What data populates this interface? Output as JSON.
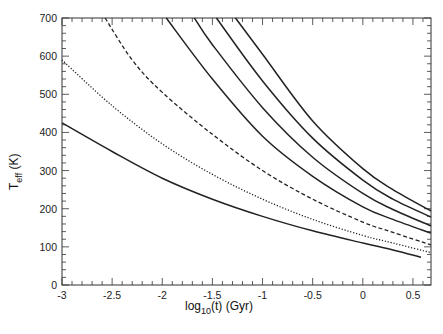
{
  "chart_data": {
    "type": "line",
    "title": "",
    "xlabel": "log10(t)  (Gyr)",
    "xlabel_parts": {
      "pre": "log",
      "sub": "10",
      "post": "(t)  (Gyr)"
    },
    "ylabel": "Teff  (K)",
    "ylabel_parts": {
      "main": "T",
      "sub": "eff",
      "post": " (K)"
    },
    "xlim": [
      -3,
      0.68
    ],
    "ylim": [
      0,
      700
    ],
    "x_ticks": [
      -3,
      -2.5,
      -2,
      -1.5,
      -1,
      -0.5,
      0,
      0.5
    ],
    "x_tick_labels": [
      "-3",
      "-2.5",
      "-2",
      "-1.5",
      "-1",
      "-0.5",
      "0",
      "0.5"
    ],
    "y_ticks": [
      0,
      100,
      200,
      300,
      400,
      500,
      600,
      700
    ],
    "y_tick_labels": [
      "0",
      "100",
      "200",
      "300",
      "400",
      "500",
      "600",
      "700"
    ],
    "grid": false,
    "legend": null,
    "series": [
      {
        "name": "curve-1",
        "style": "solid",
        "x": [
          -3.0,
          -2.5,
          -2.0,
          -1.5,
          -1.0,
          -0.5,
          0.0,
          0.3,
          0.58
        ],
        "y": [
          425,
          350,
          280,
          225,
          180,
          142,
          110,
          92,
          73
        ]
      },
      {
        "name": "curve-2",
        "style": "dotted",
        "x": [
          -3.0,
          -2.5,
          -2.0,
          -1.5,
          -1.0,
          -0.5,
          0.0,
          0.3,
          0.68
        ],
        "y": [
          590,
          470,
          370,
          290,
          225,
          172,
          130,
          110,
          85
        ]
      },
      {
        "name": "curve-3",
        "style": "dashed",
        "x": [
          -2.57,
          -2.3,
          -2.0,
          -1.5,
          -1.0,
          -0.5,
          0.0,
          0.3,
          0.68
        ],
        "y": [
          700,
          590,
          505,
          395,
          300,
          225,
          165,
          138,
          105
        ]
      },
      {
        "name": "curve-4",
        "style": "solid",
        "x": [
          -1.96,
          -1.5,
          -1.0,
          -0.5,
          0.0,
          0.3,
          0.68
        ],
        "y": [
          700,
          540,
          390,
          285,
          205,
          172,
          136
        ]
      },
      {
        "name": "curve-5",
        "style": "solid",
        "x": [
          -1.68,
          -1.5,
          -1.0,
          -0.5,
          0.0,
          0.3,
          0.68
        ],
        "y": [
          700,
          630,
          465,
          335,
          240,
          198,
          155
        ]
      },
      {
        "name": "curve-6",
        "style": "solid",
        "x": [
          -1.46,
          -1.0,
          -0.5,
          0.0,
          0.3,
          0.68
        ],
        "y": [
          700,
          535,
          385,
          275,
          225,
          178
        ]
      },
      {
        "name": "curve-7",
        "style": "solid",
        "x": [
          -1.27,
          -1.0,
          -0.5,
          0.0,
          0.3,
          0.68
        ],
        "y": [
          700,
          605,
          430,
          305,
          250,
          194
        ]
      }
    ]
  }
}
